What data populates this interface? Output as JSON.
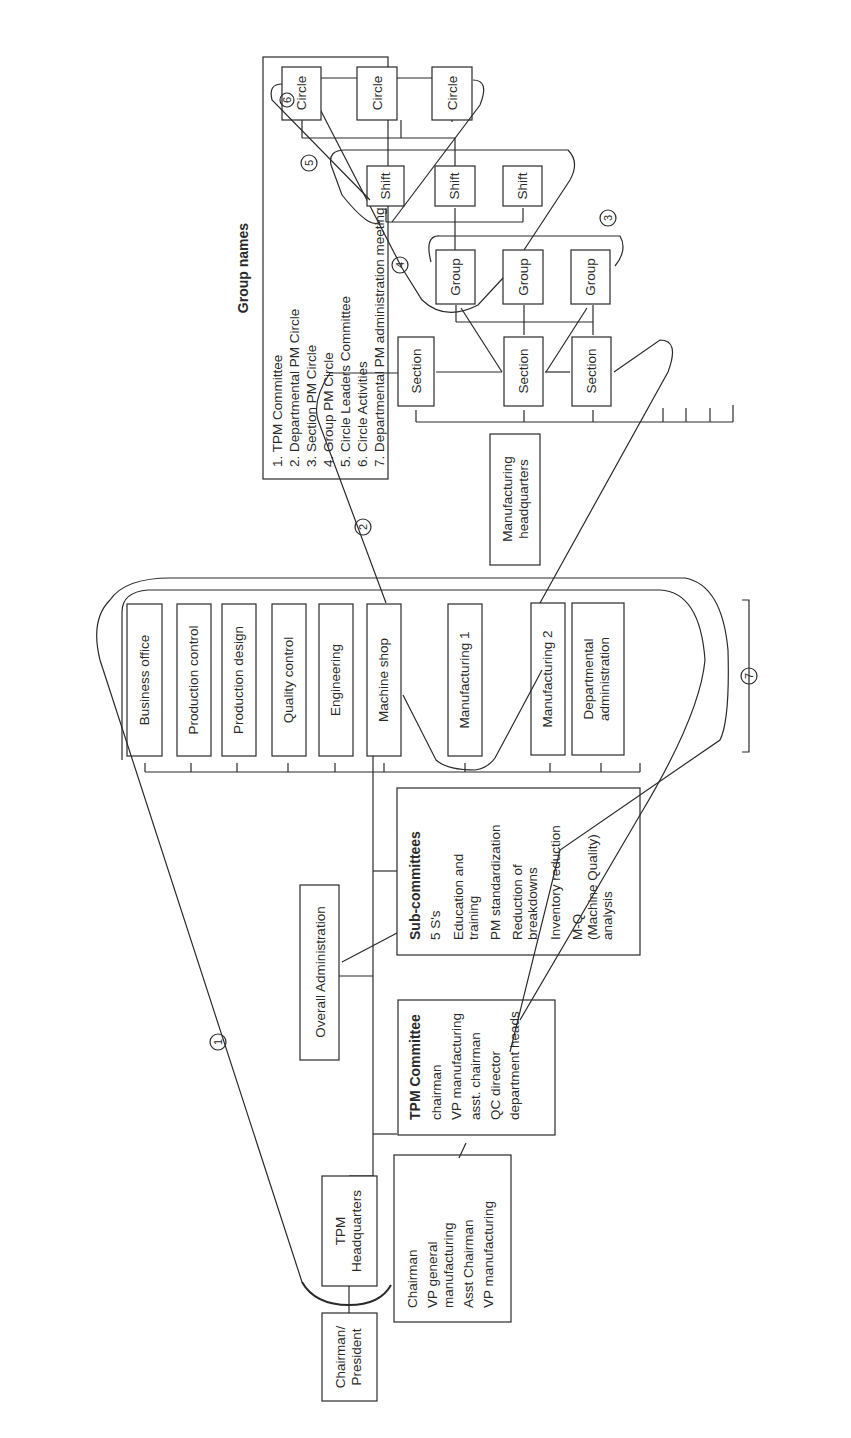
{
  "legend": {
    "title": "Group names",
    "items": [
      "1.  TPM Committee",
      "2.  Departmental PM Circle",
      "3.  Section PM Circle",
      "4.  Group PM Circle",
      "5.  Circle Leaders Committee",
      "6.  Circle Activities",
      "7.  Departmental PM administration meeting"
    ]
  },
  "nodes": {
    "chairman_president": [
      "Chairman/",
      "President"
    ],
    "tpm_headquarters": [
      "TPM",
      "Headquarters"
    ],
    "hq_members": [
      "Chairman",
      "VP general",
      "manufacturing",
      "Asst Chairman",
      "VP manufacturing"
    ],
    "tpm_committee": {
      "title": "TPM Committee",
      "members": [
        "chairman",
        "VP manufacturing",
        "asst. chairman",
        "QC director",
        "department heads"
      ]
    },
    "overall_administration": "Overall Administration",
    "sub_committees": {
      "title": "Sub-committees",
      "items": [
        "5 S's",
        "Education and",
        "training",
        "PM standardization",
        "Reduction of",
        "breakdowns",
        "Inventory reduction",
        "M-Q",
        "(Machine Quality)",
        "analysis"
      ]
    },
    "departments": [
      [
        "Business office"
      ],
      [
        "Production control"
      ],
      [
        "Production design"
      ],
      [
        "Quality control"
      ],
      [
        "Engineering"
      ],
      [
        "Machine shop"
      ],
      [
        "Manufacturing 1"
      ],
      [
        "Manufacturing 2"
      ],
      [
        "Departmental",
        "administration"
      ]
    ],
    "manufacturing_hq": [
      "Manufacturing",
      "headquarters"
    ],
    "sections": [
      "Section",
      "Section",
      "Section"
    ],
    "groups": [
      "Group",
      "Group",
      "Group"
    ],
    "shifts": [
      "Shift",
      "Shift",
      "Shift"
    ],
    "circles": [
      "Circle",
      "Circle",
      "Circle"
    ]
  },
  "markers": [
    "1",
    "2",
    "3",
    "4",
    "5",
    "6",
    "7"
  ]
}
